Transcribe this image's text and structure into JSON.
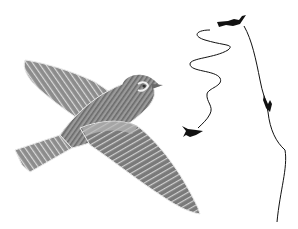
{
  "image": {
    "subject": "illustration of a lark in flight with song-flight path diagrams",
    "background": "#ffffff",
    "colors": {
      "feather_dark": "#5f5f5f",
      "feather_mid": "#8a8a8a",
      "feather_light": "#c9c9c9",
      "outline": "#e6e6e6",
      "silhouette": "#111111"
    },
    "elements": [
      {
        "name": "main-bird",
        "description": "grey engraved bird with spread wings, viewed from below, head to upper-right"
      },
      {
        "name": "flight-path-spiral",
        "description": "looping zigzag path descending to a small bird silhouette"
      },
      {
        "name": "flight-path-vertical",
        "description": "long path from top silhouette down past a diving silhouette to bottom"
      },
      {
        "name": "silhouette-top",
        "description": "small black bird silhouette at top"
      },
      {
        "name": "silhouette-diving",
        "description": "small black diving bird silhouette on vertical path"
      },
      {
        "name": "silhouette-bottom-left",
        "description": "small black bird silhouette at end of spiral path"
      }
    ]
  }
}
